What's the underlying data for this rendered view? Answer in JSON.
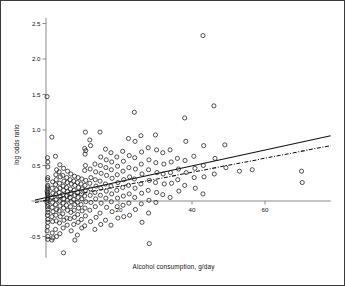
{
  "chart_data": {
    "type": "scatter",
    "title": "",
    "xlabel": "Alcohol consumption, g/day",
    "ylabel": "log odds ratio",
    "xlim": [
      -4,
      78
    ],
    "ylim": [
      -0.85,
      2.62
    ],
    "grid": false,
    "legend": "none",
    "xticks": [
      20,
      40,
      60
    ],
    "xtick_labels": [
      "20",
      "40",
      "60"
    ],
    "yticks": [
      -0.5,
      0,
      0.5,
      1.0,
      1.5,
      2.0,
      2.5
    ],
    "ytick_labels": [
      "-0.5",
      "",
      "0.5",
      "1.0",
      "1.5",
      "2.0",
      "2.5"
    ],
    "zero_line_y": 0,
    "marker": "open-circle",
    "marker_size": 3.0,
    "marker_color": "#1a1a1a",
    "axis_color": "#8a8a8a",
    "series": [
      {
        "name": "studies",
        "points": [
          [
            0.3,
            1.47
          ],
          [
            0.4,
            0.61
          ],
          [
            0.5,
            0.55
          ],
          [
            0.5,
            0.48
          ],
          [
            0.5,
            0.33
          ],
          [
            0.4,
            0.3
          ],
          [
            0.5,
            0.22
          ],
          [
            0.4,
            0.2
          ],
          [
            0.5,
            0.17
          ],
          [
            0.3,
            0.14
          ],
          [
            0.5,
            0.12
          ],
          [
            0.4,
            0.1
          ],
          [
            0.5,
            0.08
          ],
          [
            0.5,
            0.05
          ],
          [
            0.4,
            0.03
          ],
          [
            0.5,
            0.01
          ],
          [
            0.3,
            -0.02
          ],
          [
            0.5,
            -0.05
          ],
          [
            0.4,
            -0.08
          ],
          [
            0.5,
            -0.12
          ],
          [
            0.5,
            -0.16
          ],
          [
            0.4,
            -0.2
          ],
          [
            0.5,
            -0.26
          ],
          [
            0.5,
            -0.3
          ],
          [
            0.4,
            -0.36
          ],
          [
            0.3,
            -0.42
          ],
          [
            0.5,
            -0.5
          ],
          [
            0.5,
            -0.54
          ],
          [
            1.6,
            0.9
          ],
          [
            1.8,
            0.27
          ],
          [
            1.7,
            0.18
          ],
          [
            1.9,
            0.11
          ],
          [
            1.6,
            0.05
          ],
          [
            1.8,
            -0.02
          ],
          [
            1.7,
            -0.09
          ],
          [
            1.9,
            -0.15
          ],
          [
            1.6,
            -0.22
          ],
          [
            1.8,
            -0.29
          ],
          [
            1.7,
            -0.45
          ],
          [
            1.9,
            -0.52
          ],
          [
            1.6,
            -0.55
          ],
          [
            2.6,
            0.63
          ],
          [
            2.9,
            0.44
          ],
          [
            2.7,
            0.37
          ],
          [
            2.8,
            0.3
          ],
          [
            2.6,
            0.23
          ],
          [
            2.9,
            0.16
          ],
          [
            2.7,
            0.09
          ],
          [
            2.8,
            0.02
          ],
          [
            2.6,
            -0.05
          ],
          [
            2.9,
            -0.12
          ],
          [
            2.7,
            -0.2
          ],
          [
            2.8,
            -0.28
          ],
          [
            2.6,
            -0.4
          ],
          [
            2.9,
            -0.5
          ],
          [
            3.8,
            0.51
          ],
          [
            3.6,
            0.41
          ],
          [
            3.9,
            0.34
          ],
          [
            3.7,
            0.25
          ],
          [
            3.8,
            0.18
          ],
          [
            3.6,
            0.12
          ],
          [
            3.9,
            0.06
          ],
          [
            3.7,
            0.0
          ],
          [
            3.8,
            -0.07
          ],
          [
            3.6,
            -0.14
          ],
          [
            3.9,
            -0.22
          ],
          [
            3.7,
            -0.31
          ],
          [
            3.8,
            -0.46
          ],
          [
            4.8,
            0.46
          ],
          [
            4.6,
            0.36
          ],
          [
            4.9,
            0.28
          ],
          [
            4.7,
            0.21
          ],
          [
            4.8,
            0.15
          ],
          [
            4.6,
            0.09
          ],
          [
            4.9,
            0.03
          ],
          [
            4.7,
            -0.03
          ],
          [
            4.8,
            -0.1
          ],
          [
            4.6,
            -0.18
          ],
          [
            4.9,
            -0.27
          ],
          [
            4.7,
            -0.38
          ],
          [
            4.8,
            -0.73
          ],
          [
            5.9,
            0.42
          ],
          [
            5.7,
            0.33
          ],
          [
            5.8,
            0.26
          ],
          [
            5.6,
            0.19
          ],
          [
            5.9,
            0.13
          ],
          [
            5.7,
            0.07
          ],
          [
            5.8,
            0.01
          ],
          [
            5.6,
            -0.06
          ],
          [
            5.9,
            -0.13
          ],
          [
            5.7,
            -0.24
          ],
          [
            5.8,
            -0.34
          ],
          [
            6.8,
            0.38
          ],
          [
            6.6,
            0.3
          ],
          [
            6.9,
            0.24
          ],
          [
            6.7,
            0.17
          ],
          [
            6.8,
            0.11
          ],
          [
            6.6,
            0.05
          ],
          [
            6.9,
            -0.01
          ],
          [
            6.7,
            -0.08
          ],
          [
            6.8,
            -0.16
          ],
          [
            6.6,
            -0.25
          ],
          [
            6.9,
            -0.42
          ],
          [
            7.8,
            0.35
          ],
          [
            7.6,
            0.28
          ],
          [
            7.9,
            0.22
          ],
          [
            7.7,
            0.15
          ],
          [
            7.8,
            0.08
          ],
          [
            7.6,
            0.02
          ],
          [
            7.9,
            -0.05
          ],
          [
            7.7,
            -0.13
          ],
          [
            7.8,
            -0.23
          ],
          [
            7.6,
            -0.33
          ],
          [
            7.9,
            -0.55
          ],
          [
            8.8,
            0.33
          ],
          [
            8.6,
            0.26
          ],
          [
            8.9,
            0.19
          ],
          [
            8.7,
            0.12
          ],
          [
            8.8,
            0.05
          ],
          [
            8.6,
            -0.02
          ],
          [
            8.9,
            -0.1
          ],
          [
            8.7,
            -0.19
          ],
          [
            8.8,
            -0.3
          ],
          [
            8.6,
            -0.48
          ],
          [
            9.8,
            0.31
          ],
          [
            9.6,
            0.24
          ],
          [
            9.9,
            0.17
          ],
          [
            9.7,
            0.1
          ],
          [
            9.8,
            0.03
          ],
          [
            9.6,
            -0.05
          ],
          [
            9.9,
            -0.14
          ],
          [
            9.7,
            -0.26
          ],
          [
            9.8,
            -0.38
          ],
          [
            10.8,
            0.97
          ],
          [
            10.6,
            0.74
          ],
          [
            10.9,
            0.71
          ],
          [
            10.7,
            0.66
          ],
          [
            10.8,
            0.5
          ],
          [
            10.6,
            0.43
          ],
          [
            10.9,
            0.29
          ],
          [
            10.7,
            0.22
          ],
          [
            10.8,
            0.15
          ],
          [
            10.6,
            0.07
          ],
          [
            10.9,
            -0.01
          ],
          [
            10.7,
            -0.1
          ],
          [
            10.8,
            -0.21
          ],
          [
            10.6,
            -0.35
          ],
          [
            12.0,
            0.86
          ],
          [
            12.2,
            0.78
          ],
          [
            12.1,
            0.45
          ],
          [
            12.3,
            0.33
          ],
          [
            12.0,
            0.25
          ],
          [
            12.2,
            0.17
          ],
          [
            12.1,
            0.08
          ],
          [
            12.3,
            -0.02
          ],
          [
            12.0,
            -0.13
          ],
          [
            12.2,
            -0.29
          ],
          [
            13.4,
            0.52
          ],
          [
            13.6,
            0.41
          ],
          [
            13.5,
            0.3
          ],
          [
            13.7,
            0.21
          ],
          [
            13.4,
            0.12
          ],
          [
            13.6,
            0.03
          ],
          [
            13.5,
            -0.08
          ],
          [
            13.7,
            -0.23
          ],
          [
            13.4,
            -0.4
          ],
          [
            14.8,
            0.97
          ],
          [
            15.0,
            0.62
          ],
          [
            14.9,
            0.5
          ],
          [
            15.1,
            0.39
          ],
          [
            14.8,
            0.28
          ],
          [
            15.0,
            0.18
          ],
          [
            14.9,
            0.08
          ],
          [
            15.1,
            -0.03
          ],
          [
            14.8,
            -0.17
          ],
          [
            15.0,
            -0.33
          ],
          [
            16.3,
            0.73
          ],
          [
            16.5,
            0.58
          ],
          [
            16.4,
            0.47
          ],
          [
            16.6,
            0.36
          ],
          [
            16.3,
            0.24
          ],
          [
            16.5,
            0.14
          ],
          [
            16.4,
            0.04
          ],
          [
            16.6,
            -0.09
          ],
          [
            16.3,
            -0.27
          ],
          [
            17.8,
            0.68
          ],
          [
            18.0,
            0.55
          ],
          [
            17.9,
            0.44
          ],
          [
            18.1,
            0.32
          ],
          [
            17.8,
            0.21
          ],
          [
            18.0,
            0.1
          ],
          [
            17.9,
            -0.01
          ],
          [
            18.1,
            -0.15
          ],
          [
            17.8,
            -0.34
          ],
          [
            19.4,
            0.62
          ],
          [
            19.6,
            0.49
          ],
          [
            19.5,
            0.37
          ],
          [
            19.7,
            0.26
          ],
          [
            19.4,
            0.15
          ],
          [
            19.6,
            0.04
          ],
          [
            19.5,
            -0.08
          ],
          [
            19.7,
            -0.24
          ],
          [
            21.0,
            0.7
          ],
          [
            21.2,
            0.56
          ],
          [
            21.1,
            0.42
          ],
          [
            21.3,
            0.3
          ],
          [
            21.0,
            0.19
          ],
          [
            21.2,
            0.07
          ],
          [
            21.1,
            -0.06
          ],
          [
            21.3,
            -0.22
          ],
          [
            22.6,
            0.88
          ],
          [
            22.8,
            0.64
          ],
          [
            22.7,
            0.47
          ],
          [
            22.9,
            0.34
          ],
          [
            22.6,
            0.22
          ],
          [
            22.8,
            0.1
          ],
          [
            22.7,
            -0.03
          ],
          [
            22.9,
            -0.2
          ],
          [
            24.2,
            1.25
          ],
          [
            24.4,
            0.84
          ],
          [
            24.3,
            0.61
          ],
          [
            24.5,
            0.45
          ],
          [
            24.2,
            0.31
          ],
          [
            24.4,
            0.18
          ],
          [
            24.3,
            0.05
          ],
          [
            24.5,
            -0.12
          ],
          [
            26.0,
            0.92
          ],
          [
            26.2,
            0.69
          ],
          [
            26.1,
            0.52
          ],
          [
            26.3,
            0.38
          ],
          [
            26.0,
            0.24
          ],
          [
            26.2,
            0.11
          ],
          [
            26.1,
            -0.04
          ],
          [
            26.3,
            -0.3
          ],
          [
            28.0,
            0.75
          ],
          [
            28.2,
            0.58
          ],
          [
            28.1,
            0.44
          ],
          [
            28.3,
            0.29
          ],
          [
            28.0,
            0.15
          ],
          [
            28.2,
            0.01
          ],
          [
            28.1,
            -0.17
          ],
          [
            28.3,
            -0.6
          ],
          [
            30.0,
            0.93
          ],
          [
            30.3,
            0.72
          ],
          [
            30.1,
            0.54
          ],
          [
            30.4,
            0.4
          ],
          [
            30.0,
            0.26
          ],
          [
            30.3,
            0.12
          ],
          [
            30.1,
            -0.02
          ],
          [
            32.0,
            0.68
          ],
          [
            32.3,
            0.52
          ],
          [
            32.1,
            0.38
          ],
          [
            32.4,
            0.24
          ],
          [
            32.0,
            0.09
          ],
          [
            34.0,
            0.72
          ],
          [
            34.3,
            0.55
          ],
          [
            34.1,
            0.4
          ],
          [
            34.4,
            0.25
          ],
          [
            34.0,
            0.05
          ],
          [
            36.0,
            0.6
          ],
          [
            36.3,
            0.45
          ],
          [
            36.1,
            0.3
          ],
          [
            36.4,
            0.14
          ],
          [
            38.0,
            1.17
          ],
          [
            38.3,
            0.84
          ],
          [
            38.1,
            0.57
          ],
          [
            38.4,
            0.4
          ],
          [
            38.0,
            0.22
          ],
          [
            40.5,
            0.63
          ],
          [
            40.8,
            0.46
          ],
          [
            40.6,
            0.33
          ],
          [
            40.9,
            0.18
          ],
          [
            43.0,
            2.33
          ],
          [
            43.2,
            0.78
          ],
          [
            43.1,
            0.5
          ],
          [
            43.3,
            0.34
          ],
          [
            43.0,
            0.1
          ],
          [
            46.0,
            1.34
          ],
          [
            46.3,
            0.6
          ],
          [
            46.1,
            0.38
          ],
          [
            49.0,
            0.79
          ],
          [
            49.3,
            0.47
          ],
          [
            53.0,
            0.42
          ],
          [
            56.5,
            0.44
          ],
          [
            70.0,
            0.42
          ],
          [
            70.2,
            0.26
          ]
        ]
      }
    ],
    "fit_lines": [
      {
        "name": "solid-fit",
        "style": "solid",
        "x0": -3.0,
        "y0": 0.015,
        "x1": 78.0,
        "y1": 0.92
      },
      {
        "name": "dashdot-fit",
        "style": "dash-dot",
        "x0": -3.0,
        "y0": -0.02,
        "x1": 78.0,
        "y1": 0.78
      }
    ]
  }
}
